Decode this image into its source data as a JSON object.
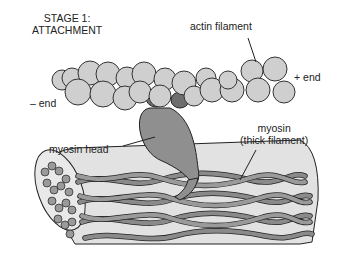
{
  "title": {
    "line1": "STAGE 1:",
    "line2": "ATTACHMENT"
  },
  "labels": {
    "actin": "actin filament",
    "minus_end": "– end",
    "plus_end": "+ end",
    "myosin_head": "myosin head",
    "myosin_line1": "myosin",
    "myosin_line2": "(thick filament)"
  },
  "colors": {
    "actin_fill": "#cfcfcf",
    "myosin_head_fill": "#8f8f8f",
    "myosin_neck_fill": "#6e6e6e",
    "thick_filament_fill": "#e2e2e2",
    "fiber_fill": "#8a8a8a",
    "outline": "#222222"
  }
}
